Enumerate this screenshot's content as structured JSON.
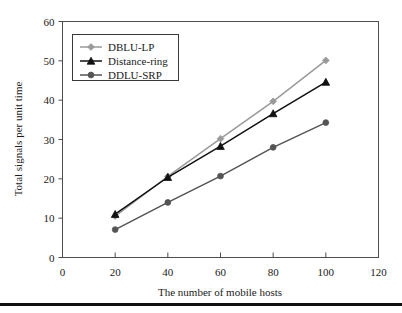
{
  "chart_data": {
    "type": "line",
    "title": "",
    "xlabel": "The number of mobile hosts",
    "ylabel": "Total signals per unit time",
    "x": [
      20,
      40,
      60,
      80,
      100
    ],
    "xlim": [
      0,
      120
    ],
    "ylim": [
      0,
      60
    ],
    "xticks": [
      "0",
      "20",
      "40",
      "60",
      "80",
      "100",
      "120"
    ],
    "yticks": [
      "0",
      "10",
      "20",
      "30",
      "40",
      "50",
      "60"
    ],
    "xtick_values": [
      0,
      20,
      40,
      60,
      80,
      100,
      120
    ],
    "ytick_values": [
      0,
      10,
      20,
      30,
      40,
      50,
      60
    ],
    "grid": false,
    "legend_position": "upper left",
    "series": [
      {
        "name": "DBLU-LP",
        "values": [
          10.5,
          20.6,
          30.2,
          39.7,
          50.1
        ],
        "color": "#9a9a9a",
        "marker": "diamond"
      },
      {
        "name": "Distance-ring",
        "values": [
          11.0,
          20.4,
          28.3,
          36.6,
          44.6
        ],
        "color": "#111111",
        "marker": "triangle"
      },
      {
        "name": "DDLU-SRP",
        "values": [
          7.1,
          14.0,
          20.7,
          28.0,
          34.3
        ],
        "color": "#545454",
        "marker": "circle"
      }
    ]
  },
  "legend": {
    "entries": [
      {
        "label": "DBLU-LP"
      },
      {
        "label": "Distance-ring"
      },
      {
        "label": "DDLU-SRP"
      }
    ]
  },
  "footer": {
    "rule_color": "#111111"
  }
}
